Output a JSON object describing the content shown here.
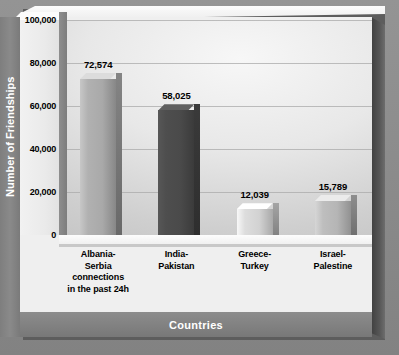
{
  "chart_data": {
    "type": "bar",
    "title": "",
    "xlabel": "Countries",
    "ylabel": "Number of Friendships",
    "categories": [
      "Albania-\nSerbia\nconnections\nin the past 24h",
      "India-\nPakistan",
      "Greece-\nTurkey",
      "Israel-\nPalestine"
    ],
    "values": [
      72574,
      58025,
      12039,
      15789
    ],
    "value_labels": [
      "72,574",
      "58,025",
      "12,039",
      "15,789"
    ],
    "ylim": [
      0,
      100000
    ],
    "ytick_values": [
      0,
      20000,
      40000,
      60000,
      80000,
      100000
    ],
    "ytick_labels": [
      "0",
      "20,000",
      "40,000",
      "60,000",
      "80,000",
      "100,000"
    ],
    "grid": true,
    "legend": "none",
    "bar_colors": [
      "#a9a9a9",
      "#4a4a4a",
      "#d2d2d2",
      "#b5b5b5"
    ]
  },
  "axes": {
    "y_title": "Number of Friendships",
    "x_title": "Countries"
  },
  "colors": {
    "frame": "#8a8a8a",
    "panel": "#efefef",
    "axis_strip": "#828282",
    "axis_strip_text": "#ffffff",
    "gridline": "#a9a9a9",
    "bar_light": "#a9a9a9",
    "bar_dark": "#4a4a4a"
  }
}
